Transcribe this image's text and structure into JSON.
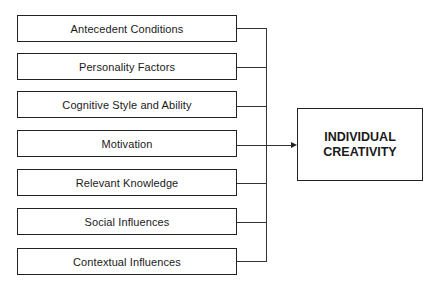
{
  "diagram": {
    "type": "flow / influence diagram",
    "factors": [
      {
        "label": "Antecedent Conditions"
      },
      {
        "label": "Personality Factors"
      },
      {
        "label": "Cognitive Style and Ability"
      },
      {
        "label": "Motivation"
      },
      {
        "label": "Relevant Knowledge"
      },
      {
        "label": "Social Influences"
      },
      {
        "label": "Contextual Influences"
      }
    ],
    "outcome": {
      "line1": "INDIVIDUAL",
      "line2": "CREATIVITY"
    },
    "edges": [
      {
        "from": "all factors",
        "to": "INDIVIDUAL CREATIVITY",
        "style": "bus-merge arrow"
      }
    ]
  }
}
